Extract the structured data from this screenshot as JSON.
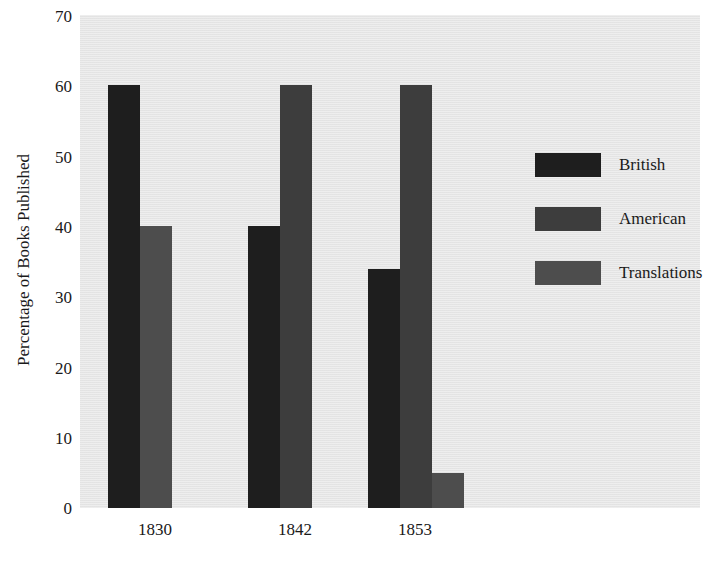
{
  "chart_data": {
    "type": "bar",
    "title": "and American Books Published in the U.S.",
    "xlabel": "",
    "ylabel": "Percentage of Books Published",
    "categories": [
      "1830",
      "1842",
      "1853"
    ],
    "series": [
      {
        "name": "British",
        "values": [
          60,
          40,
          34
        ],
        "color": "#1e1e1e"
      },
      {
        "name": "American",
        "values": [
          null,
          60,
          60
        ],
        "color": "#3d3d3d"
      },
      {
        "name": "Translations",
        "values": [
          40,
          null,
          5
        ],
        "color": "#4d4d4d"
      }
    ],
    "ylim": [
      0,
      70
    ],
    "yticks": [
      "0",
      "10",
      "20",
      "30",
      "40",
      "50",
      "60",
      "70"
    ],
    "grid": false,
    "legend_position": "right-inside",
    "plot_background": "#e7e7e7"
  },
  "bars": [
    {
      "group": "1830",
      "series": "British",
      "value": 60,
      "color": "#1e1e1e",
      "left": 28,
      "width": 32
    },
    {
      "group": "1830",
      "series": "Translations",
      "value": 40,
      "color": "#4d4d4d",
      "left": 60,
      "width": 32
    },
    {
      "group": "1842",
      "series": "British",
      "value": 40,
      "color": "#1e1e1e",
      "left": 168,
      "width": 32
    },
    {
      "group": "1842",
      "series": "American",
      "value": 60,
      "color": "#3d3d3d",
      "left": 200,
      "width": 32
    },
    {
      "group": "1853",
      "series": "British",
      "value": 34,
      "color": "#1e1e1e",
      "left": 288,
      "width": 32
    },
    {
      "group": "1853",
      "series": "American",
      "value": 60,
      "color": "#3d3d3d",
      "left": 320,
      "width": 32
    },
    {
      "group": "1853",
      "series": "Translations",
      "value": 5,
      "color": "#4d4d4d",
      "left": 352,
      "width": 32
    }
  ],
  "xticks": [
    {
      "label": "1830",
      "left": 155
    },
    {
      "label": "1842",
      "left": 295
    },
    {
      "label": "1853",
      "left": 415
    }
  ],
  "yticks": [
    {
      "label": "70",
      "top": 16
    },
    {
      "label": "60",
      "top": 86
    },
    {
      "label": "50",
      "top": 157
    },
    {
      "label": "40",
      "top": 227
    },
    {
      "label": "30",
      "top": 297
    },
    {
      "label": "20",
      "top": 368
    },
    {
      "label": "10",
      "top": 438
    },
    {
      "label": "0",
      "top": 508
    }
  ]
}
